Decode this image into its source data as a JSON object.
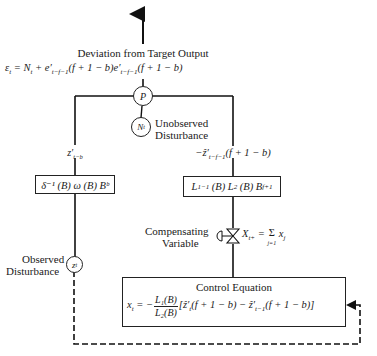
{
  "diagram": {
    "type": "feedforward-control-block-diagram",
    "output": {
      "title": "Deviation from Target Output",
      "equation": "ε_t = N_t + e′_{t−f−1}(f + 1 − b)e′_{t−f−1}(f + 1 − b)"
    },
    "nodes": {
      "sum_node": "P",
      "unobserved_node": "N_t",
      "observed_node": "z_t"
    },
    "labels": {
      "unobserved_line1": "Unobserved",
      "unobserved_line2": "Disturbance",
      "observed_line1": "Observed",
      "observed_line2": "Disturbance",
      "compensating_line1": "Compensating",
      "compensating_line2": "Variable",
      "left_signal": "z′_{t−b}",
      "right_signal": "−ẑ′_{t−f−1}(f + 1 − b)",
      "compensating_eq": "X_{t+} = Σ_{j=1} x_j"
    },
    "blocks": {
      "left_transfer": "δ⁻¹ (B) ω (B) Bᵇ",
      "right_transfer": "L₁⁻¹ (B) L₂ (B) B^{f+1}"
    },
    "control": {
      "title": "Control Equation",
      "lhs": "x_t = −",
      "numerator": "L₁(B)",
      "denominator": "L₂(B)",
      "rhs": "[ẑ′_t(f + 1 − b) − ẑ′_{t−1}(f + 1 − b)]"
    },
    "colors": {
      "line": "#1a1a1a",
      "background": "#ffffff"
    }
  }
}
